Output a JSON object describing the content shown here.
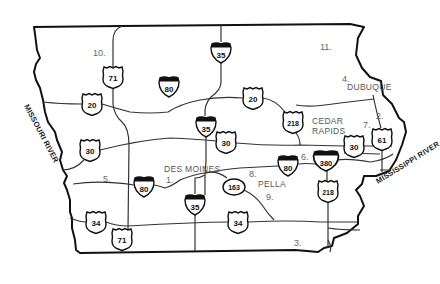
{
  "map": {
    "state": "Iowa",
    "rivers": {
      "west": "MISSOURI RIVER",
      "east": "MISSISSIPPI RIVER"
    },
    "cities": [
      {
        "name": "DES MOINES",
        "x": 164,
        "y": 172
      },
      {
        "name": "DUBUQUE",
        "x": 347,
        "y": 90
      },
      {
        "name": "CEDAR",
        "x": 312,
        "y": 124
      },
      {
        "name": "RAPIDS",
        "x": 312,
        "y": 134
      },
      {
        "name": "PELLA",
        "x": 258,
        "y": 187
      }
    ],
    "numbered_markers": [
      {
        "label": "1.",
        "x": 166,
        "y": 183
      },
      {
        "name": "2",
        "label": "2.",
        "x": 376,
        "y": 119
      },
      {
        "label": "3.",
        "x": 294,
        "y": 246
      },
      {
        "label": "4.",
        "x": 342,
        "y": 82
      },
      {
        "label": "5.",
        "x": 103,
        "y": 182
      },
      {
        "label": "6.",
        "x": 301,
        "y": 160
      },
      {
        "label": "7.",
        "x": 363,
        "y": 128
      },
      {
        "label": "8.",
        "x": 249,
        "y": 177
      },
      {
        "label": "9.",
        "x": 266,
        "y": 200
      },
      {
        "label": "10.",
        "x": 93,
        "y": 56
      },
      {
        "label": "11.",
        "x": 320,
        "y": 50
      }
    ],
    "highways": {
      "interstate": [
        {
          "number": "35",
          "x": 221,
          "y": 52
        },
        {
          "number": "80",
          "x": 169,
          "y": 86
        },
        {
          "number": "35",
          "x": 206,
          "y": 126
        },
        {
          "number": "80",
          "x": 144,
          "y": 186
        },
        {
          "number": "35",
          "x": 195,
          "y": 204
        },
        {
          "number": "80",
          "x": 288,
          "y": 165
        },
        {
          "number": "380",
          "x": 326,
          "y": 160
        }
      ],
      "us": [
        {
          "number": "71",
          "x": 113,
          "y": 77
        },
        {
          "number": "20",
          "x": 92,
          "y": 104
        },
        {
          "number": "20",
          "x": 253,
          "y": 98
        },
        {
          "number": "218",
          "x": 293,
          "y": 122
        },
        {
          "number": "30",
          "x": 90,
          "y": 150
        },
        {
          "number": "30",
          "x": 226,
          "y": 142
        },
        {
          "number": "30",
          "x": 354,
          "y": 146
        },
        {
          "number": "61",
          "x": 382,
          "y": 139
        },
        {
          "number": "218",
          "x": 328,
          "y": 191
        },
        {
          "number": "34",
          "x": 96,
          "y": 222
        },
        {
          "number": "34",
          "x": 238,
          "y": 222
        },
        {
          "number": "71",
          "x": 122,
          "y": 239
        }
      ],
      "state": [
        {
          "number": "163",
          "x": 234,
          "y": 187
        }
      ]
    }
  }
}
